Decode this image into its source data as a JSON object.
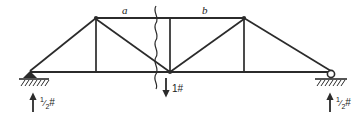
{
  "figure": {
    "name": "truss-free-body-diagram",
    "background_color": "#ffffff",
    "line_color": "#2b2b2b",
    "width": 362,
    "height": 117
  },
  "labels": {
    "panel_a": "a",
    "panel_b": "b",
    "center_load": "1#",
    "left_reaction_numerator": "1",
    "left_reaction_denominator": "2",
    "left_reaction_unit": "#",
    "right_reaction_numerator": "1",
    "right_reaction_denominator": "2",
    "right_reaction_unit": "#"
  },
  "geometry": {
    "top_chord": {
      "x1": 96,
      "y1": 18,
      "x2": 244,
      "y2": 18
    },
    "bottom_chord": {
      "x1": 30,
      "y1": 72,
      "x2": 331,
      "y2": 72
    },
    "left_apex": {
      "x": 96,
      "y": 18
    },
    "right_apex": {
      "x": 244,
      "y": 18
    },
    "center_joint": {
      "x": 170,
      "y": 72
    },
    "left_support": {
      "x": 30,
      "y": 72,
      "type": "pin"
    },
    "right_support": {
      "x": 331,
      "y": 72,
      "type": "roller"
    },
    "break_line_x": 155,
    "verticals": [
      {
        "x": 96,
        "y_top": 18,
        "y_bottom": 72
      },
      {
        "x": 170,
        "y_top": 18,
        "y_bottom": 72
      },
      {
        "x": 244,
        "y_top": 18,
        "y_bottom": 72
      }
    ],
    "diagonals": [
      {
        "x1": 30,
        "y1": 72,
        "x2": 96,
        "y2": 18
      },
      {
        "x1": 96,
        "y1": 18,
        "x2": 170,
        "y2": 72
      },
      {
        "x1": 170,
        "y1": 72,
        "x2": 244,
        "y2": 18
      },
      {
        "x1": 244,
        "y1": 18,
        "x2": 331,
        "y2": 72
      }
    ],
    "arrows": [
      {
        "name": "center-load-arrow",
        "x": 166,
        "y_start": 78,
        "y_end": 96,
        "direction": "down"
      },
      {
        "name": "left-reaction-arrow",
        "x": 33,
        "y_start": 112,
        "y_end": 92,
        "direction": "up"
      },
      {
        "name": "right-reaction-arrow",
        "x": 330,
        "y_start": 112,
        "y_end": 92,
        "direction": "up"
      }
    ]
  }
}
